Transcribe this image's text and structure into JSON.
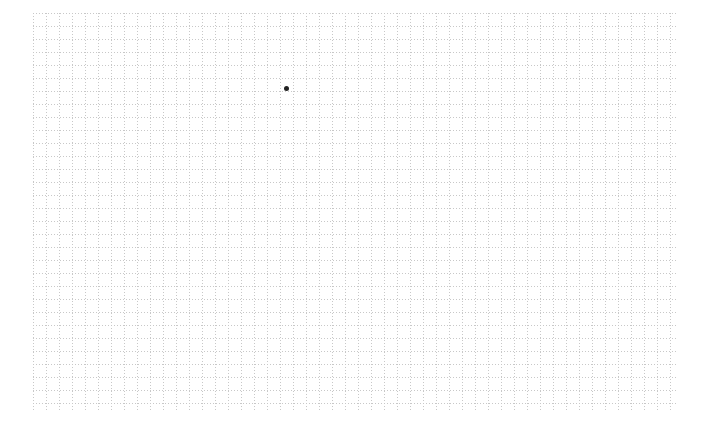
{
  "canvas": {
    "background": "#ffffff",
    "grid": {
      "left": 33,
      "top": 13,
      "width": 643,
      "height": 397,
      "cell_size": 13,
      "line_color": "#c8c8c8",
      "line_style": "dotted"
    },
    "points": [
      {
        "x": 286,
        "y": 88,
        "color": "#222222"
      }
    ]
  }
}
